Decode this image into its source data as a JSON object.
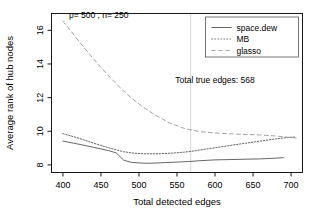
{
  "chart_data": {
    "type": "line",
    "title": "",
    "xlabel": "Total detected edges",
    "ylabel": "Average rank of hub nodes",
    "xlim": [
      385,
      715
    ],
    "ylim": [
      7.55,
      17.0
    ],
    "xticks": [
      400,
      450,
      500,
      550,
      600,
      650,
      700
    ],
    "yticks": [
      8,
      10,
      12,
      14,
      16
    ],
    "xtick_labels": [
      "400",
      "450",
      "500",
      "550",
      "600",
      "650",
      "700"
    ],
    "ytick_labels": [
      "8",
      "10",
      "12",
      "14",
      "16"
    ],
    "grid": false,
    "legend_position": "top-right",
    "annotations": [
      {
        "name": "params-annotation",
        "text": "p= 500 , n= 250",
        "x": 408,
        "y": 16.75
      },
      {
        "name": "true-edges-annotation",
        "text": "Total true edges: 568",
        "x": 600,
        "y": 12.85
      }
    ],
    "reference_lines": [
      {
        "name": "true-edges-vline",
        "orientation": "vertical",
        "x": 568,
        "color": "#cccccc"
      }
    ],
    "series": [
      {
        "name": "space.dew",
        "style": "solid",
        "color": "#555555",
        "x": [
          400,
          420,
          440,
          460,
          470,
          480,
          490,
          500,
          510,
          520,
          535,
          550,
          565,
          580,
          600,
          620,
          640,
          660,
          675,
          690
        ],
        "values": [
          9.42,
          9.24,
          9.05,
          8.85,
          8.72,
          8.28,
          8.15,
          8.12,
          8.1,
          8.11,
          8.14,
          8.17,
          8.2,
          8.25,
          8.3,
          8.32,
          8.34,
          8.36,
          8.39,
          8.43
        ]
      },
      {
        "name": "MB",
        "style": "dotted",
        "color": "#555555",
        "x": [
          400,
          420,
          440,
          460,
          480,
          495,
          510,
          525,
          540,
          555,
          568,
          585,
          600,
          620,
          640,
          660,
          680,
          695,
          705
        ],
        "values": [
          9.86,
          9.6,
          9.3,
          9.02,
          8.78,
          8.69,
          8.66,
          8.66,
          8.69,
          8.74,
          8.8,
          8.92,
          9.02,
          9.16,
          9.29,
          9.42,
          9.55,
          9.63,
          9.66
        ]
      },
      {
        "name": "glasso",
        "style": "dashed",
        "color": "#999999",
        "x": [
          400,
          415,
          430,
          445,
          460,
          475,
          490,
          505,
          520,
          540,
          560,
          580,
          600,
          620,
          640,
          660,
          680,
          700,
          708
        ],
        "values": [
          16.55,
          15.7,
          14.85,
          14.05,
          13.3,
          12.6,
          11.98,
          11.45,
          11.0,
          10.5,
          10.16,
          9.98,
          9.9,
          9.85,
          9.81,
          9.78,
          9.72,
          9.63,
          9.6
        ]
      }
    ],
    "legend": [
      {
        "label": "space.dew",
        "style": "solid",
        "color": "#555555"
      },
      {
        "label": "MB",
        "style": "dotted",
        "color": "#555555"
      },
      {
        "label": "glasso",
        "style": "dashed",
        "color": "#999999"
      }
    ]
  }
}
